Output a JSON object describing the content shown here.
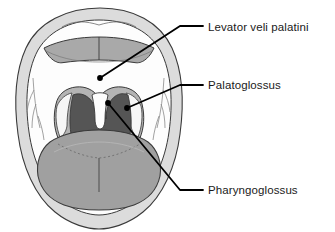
{
  "labels": [
    {
      "id": "levator-veli-palatini",
      "text": "Levator veli palatini",
      "marker": "dot",
      "point_x": 100,
      "point_y": 78
    },
    {
      "id": "palatoglossus",
      "text": "Palatoglossus",
      "marker": "dot",
      "point_x": 127,
      "point_y": 108
    },
    {
      "id": "pharyngoglossus",
      "text": "Pharyngoglossus",
      "marker": "dot",
      "point_x": 108,
      "point_y": 103
    }
  ],
  "colors": {
    "background": "#ffffff",
    "outline": "#3a3a3a",
    "lip_fill": "#dcdcdc",
    "oral_white": "#fdfdfd",
    "teeth_gum": "#a9a9a9",
    "soft_palate": "#b4b4b4",
    "oropharynx_dark": "#555555",
    "tongue": "#a0a0a0",
    "tonsil_white": "#f4f4f4",
    "leader_line": "#000000",
    "text": "#1a1a1a"
  },
  "structures": [
    {
      "id": "upper-lip",
      "name": "Upper lip"
    },
    {
      "id": "lower-lip",
      "name": "Lower lip"
    },
    {
      "id": "upper-teeth-arch",
      "name": "Upper teeth and gum arch"
    },
    {
      "id": "hard-palate",
      "name": "Hard palate"
    },
    {
      "id": "soft-palate-arch",
      "name": "Soft palate arch"
    },
    {
      "id": "oropharynx",
      "name": "Oropharynx"
    },
    {
      "id": "uvula-notch",
      "name": "Uvula notch"
    },
    {
      "id": "left-tonsillar-fossa",
      "name": "Left tonsillar fossa"
    },
    {
      "id": "right-tonsillar-fossa",
      "name": "Right tonsillar fossa"
    },
    {
      "id": "tongue",
      "name": "Tongue"
    },
    {
      "id": "median-sulcus",
      "name": "Median sulcus of tongue"
    },
    {
      "id": "terminal-sulcus",
      "name": "Terminal sulcus"
    },
    {
      "id": "left-vessel-lines",
      "name": "Left mucosal vessel lines"
    },
    {
      "id": "right-vessel-lines",
      "name": "Right mucosal vessel lines"
    }
  ]
}
